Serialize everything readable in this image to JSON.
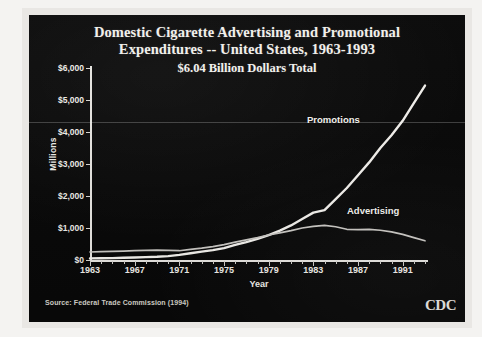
{
  "slide": {
    "title_line1": "Domestic Cigarette Advertising and Promotional",
    "title_line2": "Expenditures -- United States, 1963-1993",
    "subtitle": "$6.04 Billion Dollars Total",
    "source": "Source: Federal Trade Commission (1994)",
    "logo": "CDC",
    "background_color": "#080808",
    "foreground_color": "#f2f0ec"
  },
  "chart_data": {
    "type": "line",
    "title": "Domestic Cigarette Advertising and Promotional Expenditures -- United States, 1963-1993",
    "subtitle": "$6.04 Billion Dollars Total",
    "xlabel": "Year",
    "ylabel": "Millions",
    "xlim": [
      1963,
      1993
    ],
    "ylim": [
      0,
      6000
    ],
    "ytick_labels": [
      "$0",
      "$1,000",
      "$2,000",
      "$3,000",
      "$4,000",
      "$5,000",
      "$6,000"
    ],
    "ytick_values": [
      0,
      1000,
      2000,
      3000,
      4000,
      5000,
      6000
    ],
    "xtick_labels": [
      "1963",
      "1967",
      "1971",
      "1975",
      "1979",
      "1983",
      "1987",
      "1991"
    ],
    "xtick_values": [
      1963,
      1967,
      1971,
      1975,
      1979,
      1983,
      1987,
      1991
    ],
    "grid": false,
    "legend_position": "inline-annotations",
    "x": [
      1963,
      1964,
      1965,
      1966,
      1967,
      1968,
      1969,
      1970,
      1971,
      1972,
      1973,
      1974,
      1975,
      1976,
      1977,
      1978,
      1979,
      1980,
      1981,
      1982,
      1983,
      1984,
      1985,
      1986,
      1987,
      1988,
      1989,
      1990,
      1991,
      1992,
      1993
    ],
    "series": [
      {
        "name": "Promotions",
        "color": "#f2f0ec",
        "values": [
          50,
          55,
          60,
          70,
          80,
          90,
          100,
          120,
          160,
          210,
          260,
          310,
          370,
          470,
          560,
          660,
          780,
          920,
          1080,
          1280,
          1480,
          1560,
          1900,
          2250,
          2650,
          3050,
          3500,
          3900,
          4350,
          4900,
          5450
        ]
      },
      {
        "name": "Advertising",
        "color": "#c9c7c3",
        "values": [
          250,
          260,
          270,
          280,
          290,
          300,
          310,
          300,
          290,
          330,
          370,
          420,
          480,
          560,
          630,
          700,
          780,
          850,
          920,
          1000,
          1050,
          1080,
          1040,
          960,
          950,
          960,
          930,
          880,
          800,
          700,
          600
        ]
      }
    ],
    "annotations": [
      {
        "text": "Promotions",
        "near_year": 1986,
        "near_value": 3900
      },
      {
        "text": "Advertising",
        "near_year": 1989,
        "near_value": 1550
      }
    ],
    "source": "Source: Federal Trade Commission (1994)"
  }
}
